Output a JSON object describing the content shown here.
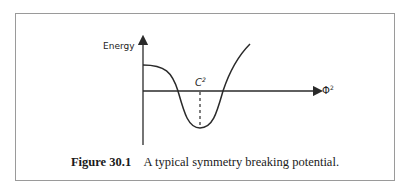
{
  "figure": {
    "ylabel": "Energy",
    "xlabel": "Φ",
    "xlabel_sup": "2",
    "marker_label": "C",
    "marker_sup": "2",
    "caption_number": "Figure 30.1",
    "caption_text": "A typical symmetry breaking potential."
  },
  "colors": {
    "line": "#2a2a2a",
    "frame": "#9a9a9a"
  }
}
